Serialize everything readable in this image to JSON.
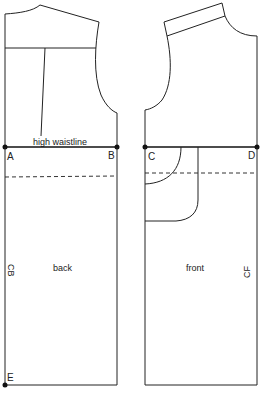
{
  "diagram": {
    "type": "sewing-pattern",
    "pieces": [
      {
        "id": "back",
        "label": "back",
        "center_label": "CB",
        "annotation": "high waistline",
        "points": [
          "A",
          "B",
          "E"
        ]
      },
      {
        "id": "front",
        "label": "front",
        "center_label": "CF",
        "points": [
          "C",
          "D"
        ]
      }
    ],
    "labels": {
      "high_waistline": "high waistline",
      "A": "A",
      "B": "B",
      "C": "C",
      "D": "D",
      "E": "E",
      "back": "back",
      "front": "front",
      "CB": "CB",
      "CF": "CF"
    },
    "colors": {
      "line": "#222222",
      "background": "#ffffff"
    }
  }
}
